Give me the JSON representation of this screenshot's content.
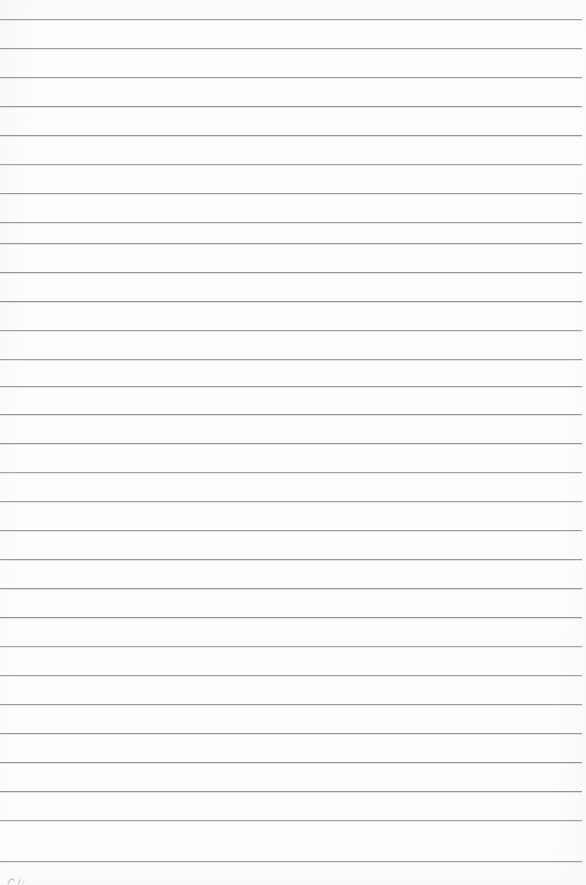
{
  "document": {
    "kind": "scanned-ruled-notebook-page",
    "page_label": "",
    "width_px": 586,
    "height_px": 885,
    "body_text": "",
    "is_blank": "true"
  },
  "paper": {
    "background_color": "#fdfdfd",
    "edge_tint_color": "#f6f6f6"
  },
  "ruling": {
    "line_color": "#8e9196",
    "line_halo_color": "#c9ccd0",
    "line_thickness_px": 1,
    "line_spacing_px": 29,
    "first_line_y_px": 19,
    "line_left_x_px": 0,
    "line_right_x_px": 582,
    "line_count": 30,
    "lines": [
      {
        "index": 1,
        "y": 19,
        "x1": 0,
        "x2": 582,
        "text": ""
      },
      {
        "index": 2,
        "y": 48,
        "x1": 0,
        "x2": 582,
        "text": ""
      },
      {
        "index": 3,
        "y": 77,
        "x1": 0,
        "x2": 582,
        "text": ""
      },
      {
        "index": 4,
        "y": 106,
        "x1": 0,
        "x2": 582,
        "text": ""
      },
      {
        "index": 5,
        "y": 135,
        "x1": 0,
        "x2": 582,
        "text": ""
      },
      {
        "index": 6,
        "y": 164,
        "x1": 0,
        "x2": 582,
        "text": ""
      },
      {
        "index": 7,
        "y": 193,
        "x1": 0,
        "x2": 582,
        "text": ""
      },
      {
        "index": 8,
        "y": 222,
        "x1": 0,
        "x2": 582,
        "text": ""
      },
      {
        "index": 9,
        "y": 243,
        "x1": 0,
        "x2": 582,
        "text": ""
      },
      {
        "index": 10,
        "y": 272,
        "x1": 0,
        "x2": 582,
        "text": ""
      },
      {
        "index": 11,
        "y": 301,
        "x1": 0,
        "x2": 582,
        "text": ""
      },
      {
        "index": 12,
        "y": 330,
        "x1": 0,
        "x2": 582,
        "text": ""
      },
      {
        "index": 13,
        "y": 359,
        "x1": 0,
        "x2": 582,
        "text": ""
      },
      {
        "index": 14,
        "y": 386,
        "x1": 0,
        "x2": 582,
        "text": ""
      },
      {
        "index": 15,
        "y": 414,
        "x1": 0,
        "x2": 582,
        "text": ""
      },
      {
        "index": 16,
        "y": 443,
        "x1": 0,
        "x2": 582,
        "text": ""
      },
      {
        "index": 17,
        "y": 472,
        "x1": 0,
        "x2": 582,
        "text": ""
      },
      {
        "index": 18,
        "y": 501,
        "x1": 0,
        "x2": 582,
        "text": ""
      },
      {
        "index": 19,
        "y": 530,
        "x1": 0,
        "x2": 582,
        "text": ""
      },
      {
        "index": 20,
        "y": 559,
        "x1": 0,
        "x2": 582,
        "text": ""
      },
      {
        "index": 21,
        "y": 588,
        "x1": 0,
        "x2": 582,
        "text": ""
      },
      {
        "index": 22,
        "y": 617,
        "x1": 0,
        "x2": 582,
        "text": ""
      },
      {
        "index": 23,
        "y": 646,
        "x1": 0,
        "x2": 582,
        "text": ""
      },
      {
        "index": 24,
        "y": 675,
        "x1": 0,
        "x2": 582,
        "text": ""
      },
      {
        "index": 25,
        "y": 704,
        "x1": 0,
        "x2": 582,
        "text": ""
      },
      {
        "index": 26,
        "y": 733,
        "x1": 0,
        "x2": 582,
        "text": ""
      },
      {
        "index": 27,
        "y": 762,
        "x1": 0,
        "x2": 582,
        "text": ""
      },
      {
        "index": 28,
        "y": 791,
        "x1": 0,
        "x2": 582,
        "text": ""
      },
      {
        "index": 29,
        "y": 820,
        "x1": 0,
        "x2": 582,
        "text": ""
      },
      {
        "index": 30,
        "y": 861,
        "x1": 0,
        "x2": 582,
        "text": ""
      }
    ]
  },
  "marks": {
    "bottom_left_ink": {
      "present": "true",
      "description": "faint cropped handwriting stroke",
      "x": 6,
      "y": 876,
      "color": "#9a9a9a",
      "legible_text": ""
    }
  }
}
